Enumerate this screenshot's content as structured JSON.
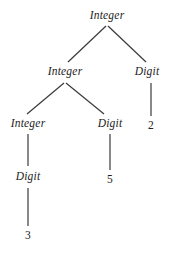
{
  "diagram": {
    "type": "derivation-tree",
    "background_color": "#ffffff",
    "text_color": "#1c1c1c",
    "edge_color": "#3a3a3a",
    "nodes": [
      {
        "id": "n0",
        "label": "Integer",
        "kind": "nonterminal",
        "x": 107,
        "y": 16
      },
      {
        "id": "n1",
        "label": "Integer",
        "kind": "nonterminal",
        "x": 65,
        "y": 72
      },
      {
        "id": "n2",
        "label": "Digit",
        "kind": "nonterminal",
        "x": 147,
        "y": 72
      },
      {
        "id": "n3",
        "label": "Integer",
        "kind": "nonterminal",
        "x": 28,
        "y": 124
      },
      {
        "id": "n4",
        "label": "Digit",
        "kind": "nonterminal",
        "x": 110,
        "y": 124
      },
      {
        "id": "n5",
        "label": "2",
        "kind": "terminal",
        "x": 151,
        "y": 126
      },
      {
        "id": "n6",
        "label": "Digit",
        "kind": "nonterminal",
        "x": 28,
        "y": 177
      },
      {
        "id": "n7",
        "label": "5",
        "kind": "terminal",
        "x": 110,
        "y": 180
      },
      {
        "id": "n8",
        "label": "3",
        "kind": "terminal",
        "x": 28,
        "y": 236
      }
    ],
    "edges": [
      {
        "id": "e0",
        "from": "n0",
        "to": "n1",
        "x1": 106,
        "y1": 26,
        "x2": 68,
        "y2": 62
      },
      {
        "id": "e1",
        "from": "n0",
        "to": "n2",
        "x1": 108,
        "y1": 26,
        "x2": 146,
        "y2": 62
      },
      {
        "id": "e2",
        "from": "n1",
        "to": "n3",
        "x1": 64,
        "y1": 83,
        "x2": 27,
        "y2": 114
      },
      {
        "id": "e3",
        "from": "n1",
        "to": "n4",
        "x1": 66,
        "y1": 83,
        "x2": 104,
        "y2": 114
      },
      {
        "id": "e4",
        "from": "n2",
        "to": "n5",
        "x1": 151,
        "y1": 83,
        "x2": 151,
        "y2": 116
      },
      {
        "id": "e5",
        "from": "n3",
        "to": "n6",
        "x1": 28,
        "y1": 134,
        "x2": 28,
        "y2": 166
      },
      {
        "id": "e6",
        "from": "n4",
        "to": "n7",
        "x1": 110,
        "y1": 134,
        "x2": 110,
        "y2": 170
      },
      {
        "id": "e7",
        "from": "n6",
        "to": "n8",
        "x1": 28,
        "y1": 188,
        "x2": 28,
        "y2": 226
      }
    ]
  }
}
